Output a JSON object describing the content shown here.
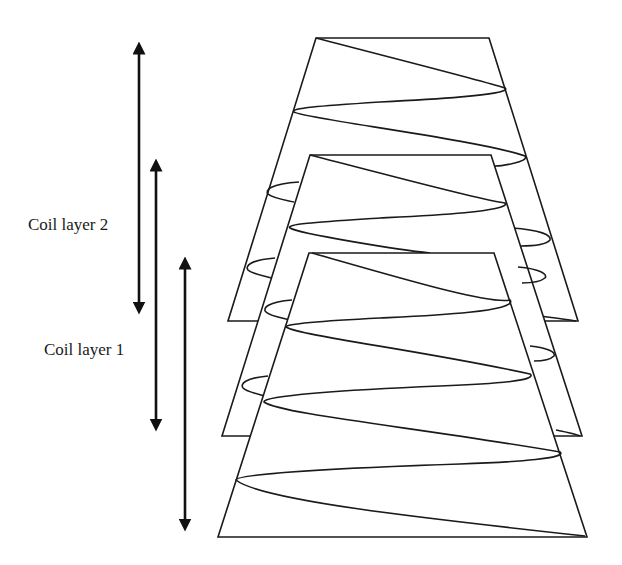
{
  "diagram": {
    "type": "coil-layers-schematic",
    "labels": {
      "layer2": "Coil layer 2",
      "layer1": "Coil layer 1"
    },
    "colors": {
      "stroke": "#1a1a1a",
      "background": "#ffffff"
    },
    "arrows": [
      {
        "name": "coil-layer-2-extent",
        "x": 139,
        "y1": 38,
        "y2": 318
      },
      {
        "name": "coil-layer-1-extent",
        "x": 156,
        "y1": 155,
        "y2": 435
      },
      {
        "name": "front-layer-extent",
        "x": 185,
        "y1": 253,
        "y2": 535
      }
    ],
    "layers": [
      {
        "name": "back-layer",
        "top_y": 38,
        "top_x": [
          316,
          489
        ],
        "bottom_y": 321,
        "bottom_x": [
          228,
          578
        ]
      },
      {
        "name": "middle-layer",
        "top_y": 155,
        "top_x": [
          310,
          491
        ],
        "bottom_y": 436,
        "bottom_x": [
          222,
          582
        ]
      },
      {
        "name": "front-layer",
        "top_y": 253,
        "top_x": [
          309,
          494
        ],
        "bottom_y": 537,
        "bottom_x": [
          218,
          587
        ]
      }
    ]
  }
}
